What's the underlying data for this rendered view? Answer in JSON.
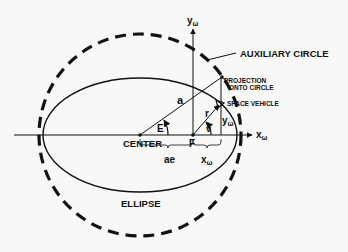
{
  "diagram": {
    "labels": {
      "y_axis": "y",
      "y_axis_sub": "ω",
      "x_axis": "x",
      "x_axis_sub": "ω",
      "auxiliary_circle": "AUXILIARY CIRCLE",
      "projection_line1": "PROJECTION",
      "projection_line2": "ONTO CIRCLE",
      "space_vehicle": "SPACE VEHICLE",
      "semi_major": "a",
      "radius": "r",
      "eccentric_anomaly": "E",
      "true_anomaly": "v",
      "y_omega": "y",
      "y_omega_sub": "ω",
      "center": "CENTER",
      "focus": "F",
      "ae": "ae",
      "x_omega": "x",
      "x_omega_sub": "ω",
      "ellipse": "ELLIPSE"
    },
    "colors": {
      "ink": "#111111",
      "background": "#f8f8f6"
    }
  }
}
